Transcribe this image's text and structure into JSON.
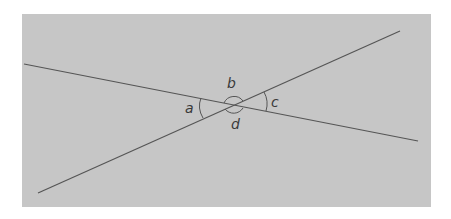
{
  "diagram": {
    "type": "intersecting-lines-angles",
    "background_color": "#c6c6c6",
    "line_color": "#555555",
    "lines": [
      {
        "name": "line-1",
        "x1": 24,
        "y1": 64,
        "x2": 418,
        "y2": 141
      },
      {
        "name": "line-2",
        "x1": 38,
        "y1": 193,
        "x2": 400,
        "y2": 31
      }
    ],
    "intersection": {
      "x": 234,
      "y": 105
    },
    "angle_labels": {
      "a": "a",
      "b": "b",
      "c": "c",
      "d": "d"
    }
  }
}
